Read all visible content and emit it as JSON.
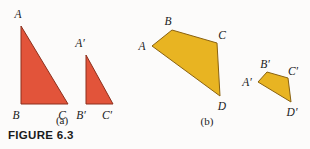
{
  "figure": {
    "caption": "FIGURE 6.3",
    "background_color": "#fcfbfa",
    "panels": [
      {
        "id": "a",
        "label": "(a)",
        "label_pos": {
          "x": 62,
          "y": 124
        },
        "shape_type": "triangle",
        "fill_color": "#e2543a",
        "stroke_color": "#8c2f1c",
        "shapes": [
          {
            "name": "triangle-abc",
            "points": "21,26 21,104 68,104",
            "vertices": [
              {
                "label": "A",
                "x": 18,
                "y": 18
              },
              {
                "label": "B",
                "x": 16,
                "y": 119
              },
              {
                "label": "C",
                "x": 62,
                "y": 119
              }
            ]
          },
          {
            "name": "triangle-abc-prime",
            "points": "86,55 86,104 113,104",
            "vertices": [
              {
                "label": "A′",
                "x": 80,
                "y": 47
              },
              {
                "label": "B′",
                "x": 80,
                "y": 119
              },
              {
                "label": "C′",
                "x": 106,
                "y": 119
              }
            ]
          }
        ]
      },
      {
        "id": "b",
        "label": "(b)",
        "label_pos": {
          "x": 207,
          "y": 125
        },
        "shape_type": "quadrilateral",
        "fill_color": "#e8b422",
        "stroke_color": "#8a6210",
        "shapes": [
          {
            "name": "quadrilateral-abcd",
            "points": "152,46 172,30 217,43 220,96",
            "vertices": [
              {
                "label": "A",
                "x": 140,
                "y": 50
              },
              {
                "label": "B",
                "x": 166,
                "y": 25
              },
              {
                "label": "C",
                "x": 220,
                "y": 39
              },
              {
                "label": "D",
                "x": 218,
                "y": 110
              }
            ]
          },
          {
            "name": "quadrilateral-abcd-prime",
            "points": "258,82 267,72 288,78 291,102",
            "vertices": [
              {
                "label": "A′",
                "x": 243,
                "y": 85
              },
              {
                "label": "B′",
                "x": 262,
                "y": 68
              },
              {
                "label": "C′",
                "x": 290,
                "y": 75
              },
              {
                "label": "D′",
                "x": 288,
                "y": 116
              }
            ]
          }
        ]
      }
    ]
  }
}
